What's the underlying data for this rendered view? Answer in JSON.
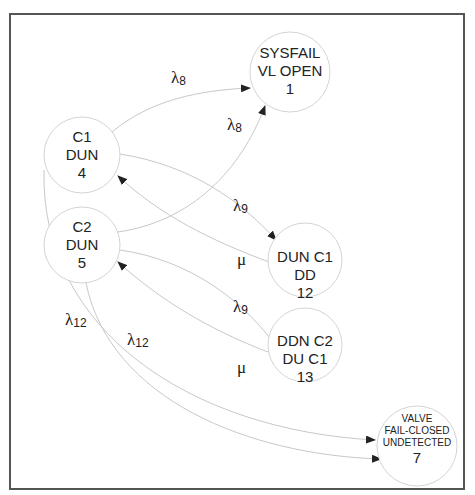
{
  "diagram": {
    "type": "markov-state-transition",
    "nodes": [
      {
        "id": "1",
        "lines": [
          "SYSFAIL",
          "VL OPEN",
          "1"
        ]
      },
      {
        "id": "4",
        "lines": [
          "C1",
          "DUN",
          "4"
        ]
      },
      {
        "id": "5",
        "lines": [
          "C2",
          "DUN",
          "5"
        ]
      },
      {
        "id": "12",
        "lines": [
          "DUN C1",
          "DD",
          "12"
        ]
      },
      {
        "id": "13",
        "lines": [
          "DDN C2",
          "DU C1",
          "13"
        ]
      },
      {
        "id": "7",
        "lines": [
          "VALVE",
          "FAIL-CLOSED",
          "UNDETECTED",
          "7"
        ]
      }
    ],
    "edges": [
      {
        "from": "4",
        "to": "1",
        "symbol": "λ",
        "subscript": "8"
      },
      {
        "from": "5",
        "to": "1",
        "symbol": "λ",
        "subscript": "8"
      },
      {
        "from": "4",
        "to": "12",
        "symbol": "λ",
        "subscript": "9"
      },
      {
        "from": "12",
        "to": "4",
        "symbol": "μ",
        "subscript": ""
      },
      {
        "from": "5",
        "to": "13",
        "symbol": "λ",
        "subscript": "9"
      },
      {
        "from": "13",
        "to": "5",
        "symbol": "μ",
        "subscript": ""
      },
      {
        "from": "4",
        "to": "7",
        "symbol": "λ",
        "subscript": "12"
      },
      {
        "from": "5",
        "to": "7",
        "symbol": "λ",
        "subscript": "12"
      }
    ]
  },
  "colors": {
    "frame": "#555555",
    "edge": "#c8c8c8",
    "node_stroke": "#d4d4d4",
    "text": "#222222",
    "arrow": "#222222"
  }
}
